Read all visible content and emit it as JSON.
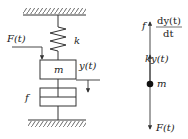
{
  "left_diagram": {
    "force_label": "F(t)",
    "spring_label": "k",
    "mass_label": "m",
    "displacement_label": "y(t)",
    "damper_label": "f"
  },
  "right_diagram": {
    "damping_force": {
      "coeff": "f",
      "numerator": "dy(t)",
      "denominator": "dt"
    },
    "spring_force_label": "ky(t)",
    "mass_label": "m",
    "applied_force_label": "F(t)"
  },
  "colors": {
    "stroke": "#333333",
    "background": "#ffffff"
  }
}
